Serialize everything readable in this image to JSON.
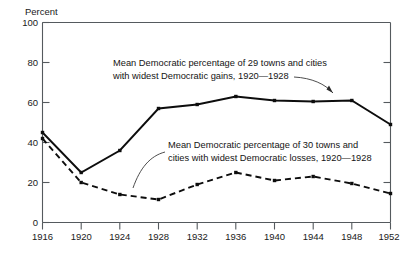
{
  "chart_data": {
    "type": "line",
    "title": "",
    "xlabel": "",
    "ylabel": "Percent",
    "ylim": [
      0,
      100
    ],
    "xlim": [
      1916,
      1952
    ],
    "grid": false,
    "legend_position": "inline-annotations",
    "x": [
      1916,
      1920,
      1924,
      1928,
      1932,
      1936,
      1940,
      1944,
      1948,
      1952
    ],
    "xticklabels": [
      "1916",
      "1920",
      "1924",
      "1928",
      "1932",
      "1936",
      "1940",
      "1944",
      "1948",
      "1952"
    ],
    "yticks": [
      0,
      20,
      40,
      60,
      80,
      100
    ],
    "yticklabels": [
      "0",
      "20",
      "40",
      "60",
      "80",
      "100"
    ],
    "series": [
      {
        "name": "Mean Democratic percentage of 29 towns and cities with widest Democratic gains, 1920—1928",
        "style": "solid",
        "values": [
          45,
          25,
          36,
          57,
          59,
          63,
          61,
          60.5,
          61,
          49
        ]
      },
      {
        "name": "Mean Democratic percentage of 30 towns and cities with widest Democratic losses, 1920—1928",
        "style": "dashed",
        "values": [
          42,
          20,
          14,
          11.5,
          19,
          25,
          21,
          23,
          19.5,
          14.5
        ]
      }
    ],
    "annotations": [
      {
        "id": "gains-label",
        "line1": "Mean Democratic percentage of 29 towns and cities",
        "line2": "with widest Democratic gains, 1920—1928",
        "points_to_series": "solid"
      },
      {
        "id": "losses-label",
        "line1": "Mean Democratic percentage of 30 towns and",
        "line2": "cities with widest Democratic losses, 1920—1928",
        "points_to_series": "dashed"
      }
    ],
    "colors": {
      "series_line": "#0d0d0d",
      "axis": "#555a5e",
      "text": "#1a1a1a",
      "background": "#ffffff"
    }
  },
  "footer": {
    "caption": ""
  }
}
